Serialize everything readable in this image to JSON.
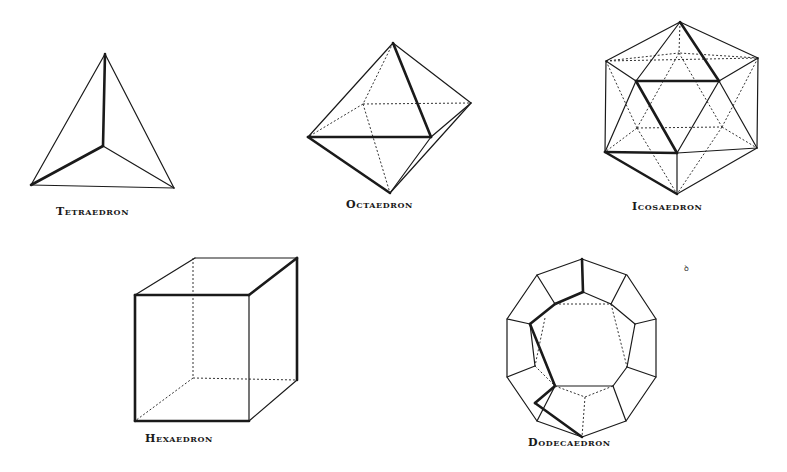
{
  "figures": [
    {
      "id": "tetrahedron",
      "label": "Tetraedron",
      "faces": 4
    },
    {
      "id": "octahedron",
      "label": "Octaedron",
      "faces": 8
    },
    {
      "id": "icosahedron",
      "label": "Icosaedron",
      "faces": 20
    },
    {
      "id": "hexahedron",
      "label": "Hexaedron",
      "faces": 6
    },
    {
      "id": "dodecahedron",
      "label": "Dodecaedron",
      "faces": 12
    }
  ],
  "stray_mark": "ꝺ",
  "colors": {
    "ink": "#1a1a1a",
    "paper": "#ffffff"
  }
}
